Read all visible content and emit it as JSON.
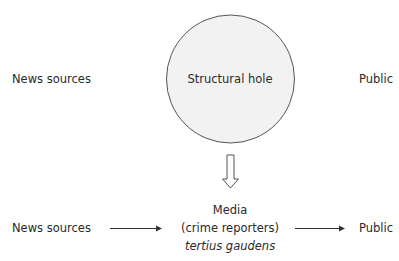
{
  "diagram": {
    "top_row": {
      "left_node": "News sources",
      "center_node": "Structural hole",
      "right_node": "Public"
    },
    "transition_arrow": "hollow-down-arrow",
    "bottom_row": {
      "left_node": "News sources",
      "center_node": {
        "line1": "Media",
        "line2": "(crime reporters)",
        "line3": "tertius gaudens"
      },
      "right_node": "Public"
    },
    "colors": {
      "circle_fill": "#f2f2f2",
      "stroke": "#555555",
      "text": "#2a2a2a"
    }
  }
}
